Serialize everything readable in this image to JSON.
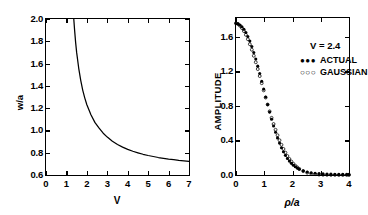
{
  "figure": {
    "panels": [
      "left-plot",
      "right-plot"
    ]
  },
  "chart_data": [
    {
      "id": "left-plot",
      "type": "line",
      "title": "",
      "xlabel": "V",
      "ylabel": "w/a",
      "xlim": [
        0,
        7
      ],
      "ylim": [
        0.6,
        2.0
      ],
      "xticks": [
        0,
        1,
        2,
        3,
        4,
        5,
        6,
        7
      ],
      "xticklabels": [
        "0",
        "1",
        "2",
        "3",
        "4",
        "5",
        "6",
        "7"
      ],
      "yticks": [
        0.6,
        0.8,
        1.0,
        1.2,
        1.4,
        1.6,
        1.8,
        2.0
      ],
      "yticklabels": [
        "0.6",
        "0.8",
        "1.0",
        "1.2",
        "1.4",
        "1.6",
        "1.8",
        "2.0"
      ],
      "grid": false,
      "legend": "none",
      "series": [
        {
          "name": "w/a vs V",
          "x": [
            1.36,
            1.4,
            1.45,
            1.5,
            1.6,
            1.7,
            1.8,
            1.9,
            2.0,
            2.2,
            2.4,
            2.6,
            2.8,
            3.0,
            3.25,
            3.5,
            3.75,
            4.0,
            4.25,
            4.5,
            4.75,
            5.0,
            5.25,
            5.5,
            5.75,
            6.0,
            6.25,
            6.5,
            6.75,
            7.0
          ],
          "y": [
            2.0,
            1.9,
            1.79,
            1.7,
            1.56,
            1.45,
            1.36,
            1.29,
            1.23,
            1.14,
            1.07,
            1.02,
            0.975,
            0.94,
            0.903,
            0.874,
            0.85,
            0.83,
            0.813,
            0.799,
            0.786,
            0.775,
            0.766,
            0.757,
            0.75,
            0.743,
            0.737,
            0.731,
            0.727,
            0.722
          ]
        }
      ]
    },
    {
      "id": "right-plot",
      "type": "scatter",
      "title": "",
      "xlabel": "ρ/a",
      "ylabel": "AMPLITUDE",
      "xlim": [
        0,
        4
      ],
      "ylim": [
        0.0,
        1.82
      ],
      "xticks": [
        0,
        1,
        2,
        3,
        4
      ],
      "xticklabels": [
        "0",
        "1",
        "2",
        "3",
        "4"
      ],
      "yticks": [
        0.0,
        0.4,
        0.8,
        1.2,
        1.6
      ],
      "yticklabels": [
        "0.0",
        "0.4",
        "0.8",
        "1.2",
        "1.6"
      ],
      "grid": false,
      "legend": "inside-top-right",
      "annotation": "V = 2.4",
      "series": [
        {
          "name": "ACTUAL",
          "marker": "filled-circle",
          "x": [
            0.0,
            0.07,
            0.14,
            0.21,
            0.28,
            0.35,
            0.42,
            0.49,
            0.56,
            0.63,
            0.7,
            0.77,
            0.84,
            0.91,
            0.98,
            1.05,
            1.12,
            1.19,
            1.26,
            1.33,
            1.4,
            1.47,
            1.54,
            1.61,
            1.68,
            1.75,
            1.82,
            1.89,
            1.96,
            2.03,
            2.1,
            2.17,
            2.24,
            2.38,
            2.52,
            2.66,
            2.8,
            2.94,
            3.08,
            3.22,
            3.36,
            3.5,
            3.64,
            3.78,
            3.92,
            4.0
          ],
          "y": [
            1.755,
            1.75,
            1.738,
            1.718,
            1.69,
            1.652,
            1.606,
            1.552,
            1.49,
            1.42,
            1.344,
            1.262,
            1.176,
            1.086,
            0.996,
            0.905,
            0.816,
            0.729,
            0.646,
            0.568,
            0.496,
            0.43,
            0.37,
            0.316,
            0.269,
            0.228,
            0.192,
            0.161,
            0.135,
            0.113,
            0.095,
            0.08,
            0.067,
            0.048,
            0.035,
            0.026,
            0.02,
            0.016,
            0.013,
            0.011,
            0.01,
            0.009,
            0.008,
            0.008,
            0.007,
            0.007
          ]
        },
        {
          "name": "GAUSSIAN",
          "marker": "open-circle",
          "x": [
            0.0,
            0.07,
            0.14,
            0.21,
            0.28,
            0.35,
            0.42,
            0.49,
            0.56,
            0.63,
            0.7,
            0.77,
            0.84,
            0.91,
            0.98,
            1.05,
            1.12,
            1.19,
            1.26,
            1.33,
            1.4,
            1.47,
            1.54,
            1.61,
            1.68,
            1.75,
            1.82,
            1.89,
            1.96,
            2.03,
            2.1,
            2.17,
            2.24,
            2.38,
            2.52,
            2.66,
            2.8,
            2.94,
            3.08,
            3.22,
            3.36,
            3.5,
            3.64,
            3.78,
            3.92,
            4.0
          ],
          "y": [
            1.76,
            1.752,
            1.73,
            1.703,
            1.668,
            1.625,
            1.574,
            1.516,
            1.452,
            1.382,
            1.307,
            1.228,
            1.147,
            1.064,
            0.981,
            0.898,
            0.817,
            0.738,
            0.663,
            0.591,
            0.524,
            0.461,
            0.403,
            0.35,
            0.302,
            0.259,
            0.22,
            0.186,
            0.156,
            0.13,
            0.107,
            0.088,
            0.071,
            0.045,
            0.027,
            0.016,
            0.009,
            0.005,
            0.003,
            0.002,
            0.001,
            0.001,
            0.0,
            0.0,
            0.0,
            0.0
          ]
        }
      ]
    }
  ],
  "left": {
    "axis_titles": {
      "x": "V",
      "y": "w/a"
    },
    "yticklabels": [
      "2.0",
      "1.8",
      "1.6",
      "1.4",
      "1.2",
      "1.0",
      "0.8",
      "0.6"
    ],
    "xticklabels": [
      "0",
      "1",
      "2",
      "3",
      "4",
      "5",
      "6",
      "7"
    ]
  },
  "right": {
    "axis_titles": {
      "x": "ρ/a",
      "y": "AMPLITUDE"
    },
    "yticklabels": [
      "1.6",
      "1.2",
      "0.8",
      "0.4",
      "0.0"
    ],
    "xticklabels": [
      "0",
      "1",
      "2",
      "3",
      "4"
    ],
    "condition_label": "V = 2.4",
    "legend": [
      {
        "marks": "●●●",
        "label": "ACTUAL"
      },
      {
        "marks": "○○○",
        "label": "GAUSSIAN"
      }
    ]
  },
  "colors": {
    "ink": "#000000",
    "background": "#ffffff"
  }
}
